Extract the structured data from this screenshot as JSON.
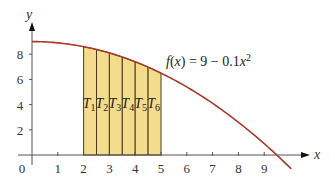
{
  "chart_data": {
    "type": "area",
    "title": "",
    "xlabel": "x",
    "ylabel": "y",
    "xlim": [
      0,
      10.2
    ],
    "ylim": [
      0,
      9.8
    ],
    "x_ticks": [
      "0",
      "1",
      "2",
      "3",
      "4",
      "5",
      "6",
      "7",
      "8",
      "9"
    ],
    "y_ticks": [
      "2",
      "4",
      "6",
      "8"
    ],
    "grid": false,
    "function": {
      "label": "f(x) = 9 − 0.1x²",
      "expression": "9 - 0.1*x^2",
      "color": "#a83a2e",
      "x_range": [
        0,
        10
      ]
    },
    "trapezoids": {
      "fill": "#f3dc8c",
      "edge": "#4a3b1a",
      "a": 2,
      "b": 5,
      "n": 6,
      "width": 0.5,
      "labels": [
        "T1",
        "T2",
        "T3",
        "T4",
        "T5",
        "T6"
      ],
      "x_edges": [
        2,
        2.5,
        3,
        3.5,
        4,
        4.5,
        5
      ],
      "heights": [
        8.6,
        8.375,
        8.1,
        7.775,
        7.4,
        6.975,
        6.5
      ]
    },
    "annotations": [
      {
        "text": "f(x) = 9 − 0.1x²",
        "x": 6.4,
        "y": 7.0
      }
    ]
  },
  "labels": {
    "x_axis": "x",
    "y_axis": "y",
    "func_f": "f",
    "func_rest_open": "(",
    "func_x": "x",
    "func_rest": ") = 9 − 0.1",
    "func_x2": "x",
    "func_exp": "2"
  }
}
